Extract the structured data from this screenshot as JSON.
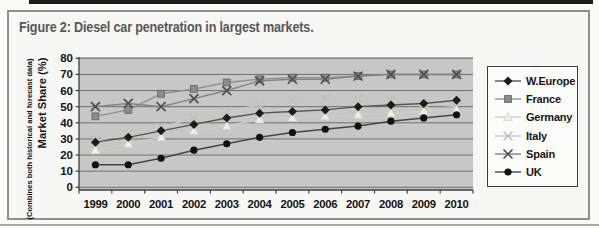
{
  "figure": {
    "title": "Figure 2: Diesel car penetration in largest markets."
  },
  "chart_data": {
    "type": "line",
    "title": "Figure 2: Diesel car penetration in largest markets.",
    "categories": [
      "1999",
      "2000",
      "2001",
      "2002",
      "2003",
      "2004",
      "2005",
      "2006",
      "2007",
      "2008",
      "2009",
      "2010"
    ],
    "series": [
      {
        "name": "W.Europe",
        "marker": "diamond",
        "line_color": "#555555",
        "marker_color": "#1b1b1b",
        "marker_stroke": "#1b1b1b",
        "values": [
          28,
          31,
          35,
          39,
          43,
          46,
          47,
          48,
          50,
          51,
          52,
          54
        ]
      },
      {
        "name": "France",
        "marker": "square",
        "line_color": "#919191",
        "marker_color": "#8d8d8d",
        "marker_stroke": "#686868",
        "values": [
          44,
          48,
          58,
          61,
          65,
          67,
          68,
          68,
          69,
          70,
          70,
          70
        ]
      },
      {
        "name": "Germany",
        "marker": "triangle",
        "line_color": "#cfcec2",
        "marker_color": "#f3f0dd",
        "marker_stroke": "#d6d3be",
        "values": [
          23,
          27,
          31,
          35,
          38,
          42,
          43,
          44,
          45,
          46,
          47,
          48
        ]
      },
      {
        "name": "Italy",
        "marker": "x",
        "line_color": "#c9c8c0",
        "marker_color": "#c2c1b8",
        "marker_stroke": "#c2c1b8",
        "barely_visible": true,
        "values": [
          29,
          33,
          37,
          43,
          47,
          51,
          54,
          55,
          55,
          54,
          52,
          50
        ]
      },
      {
        "name": "Spain",
        "marker": "x",
        "line_color": "#828282",
        "marker_color": "#4f4f4f",
        "marker_stroke": "#4f4f4f",
        "values": [
          50,
          52,
          50,
          55,
          60,
          66,
          67,
          67,
          69,
          70,
          70,
          70
        ]
      },
      {
        "name": "UK",
        "marker": "circle",
        "line_color": "#454545",
        "marker_color": "#101010",
        "marker_stroke": "#101010",
        "values": [
          14,
          14,
          18,
          23,
          27,
          31,
          34,
          36,
          38,
          41,
          43,
          45
        ]
      }
    ],
    "xlabel": "",
    "ylabel": "Market Share (%)",
    "ylabel_note": "(Combines both historical and forecast data)",
    "ylim": [
      0,
      80
    ],
    "yticks": [
      0,
      10,
      20,
      30,
      40,
      50,
      60,
      70,
      80
    ],
    "grid": "horizontal",
    "legend_position": "right",
    "plot_bg": "#c7c7c7"
  },
  "colors": {
    "frame_border": "#8f8f8d",
    "title_text": "#585856",
    "top_rule": "#1e1e1e",
    "gridline": "#6f6f6f",
    "axis": "#3f3f3f"
  }
}
